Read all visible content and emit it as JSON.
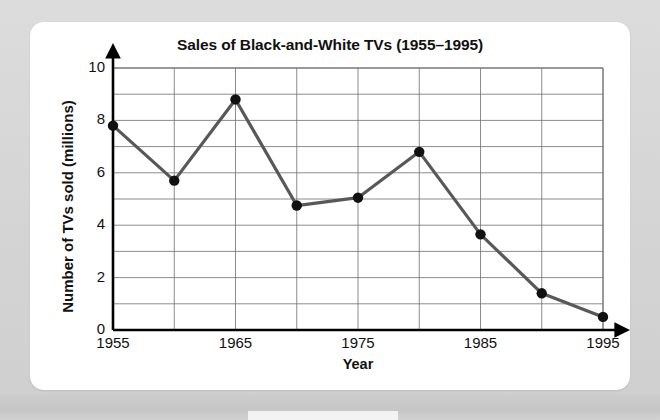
{
  "card": {
    "title": "Sales of Black-and-White TVs (1955–1995)"
  },
  "axes": {
    "xlabel": "Year",
    "ylabel": "Number of TVs sold (millions)",
    "ytick_labels": [
      "0",
      "2",
      "4",
      "6",
      "8",
      "10"
    ],
    "xtick_labels": [
      "1955",
      "1965",
      "1975",
      "1985",
      "1995"
    ]
  },
  "chart_data": {
    "type": "line",
    "title": "Sales of Black-and-White TVs (1955–1995)",
    "xlabel": "Year",
    "ylabel": "Number of TVs sold (millions)",
    "x": [
      1955,
      1960,
      1965,
      1970,
      1975,
      1980,
      1985,
      1990,
      1995
    ],
    "values": [
      7.8,
      5.7,
      8.8,
      4.75,
      5.05,
      6.8,
      3.65,
      1.4,
      0.5
    ],
    "series": [
      {
        "name": "Number of TVs sold (millions)",
        "values": [
          7.8,
          5.7,
          8.8,
          4.75,
          5.05,
          6.8,
          3.65,
          1.4,
          0.5
        ]
      }
    ],
    "xlim": [
      1955,
      1995
    ],
    "ylim": [
      0,
      10
    ],
    "xticks": [
      1955,
      1965,
      1975,
      1985,
      1995
    ],
    "yticks": [
      0,
      2,
      4,
      6,
      8,
      10
    ],
    "x_minor_step": 5,
    "y_minor_step": 1,
    "grid": true,
    "legend": "none",
    "line_color": "#585858",
    "marker_color": "#111111",
    "grid_color": "#6f6f6f",
    "marker": "circle"
  }
}
